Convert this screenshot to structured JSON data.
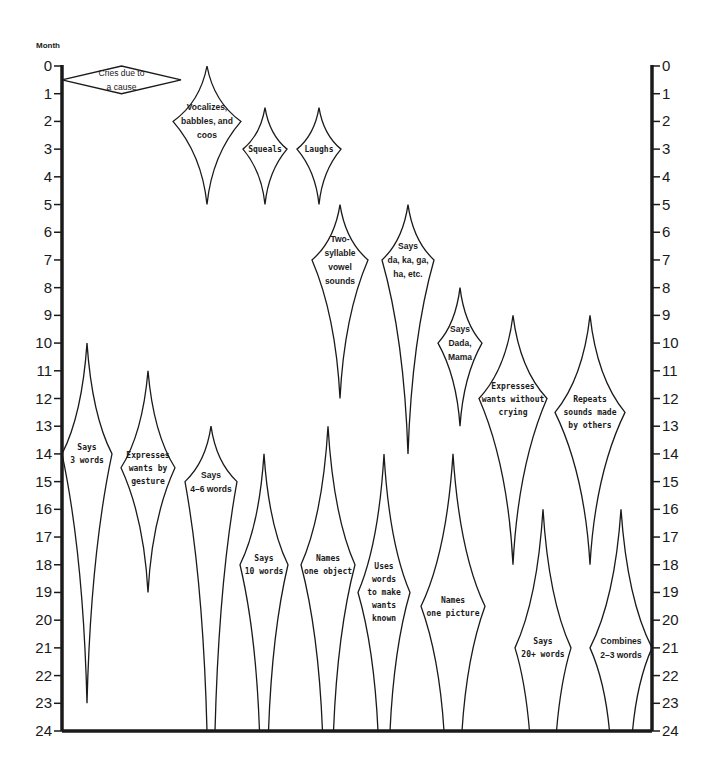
{
  "chart_data": {
    "type": "range-diagram",
    "title": "",
    "ylabel": "Month",
    "ylim": [
      0,
      24
    ],
    "y_ticks": [
      0,
      1,
      2,
      3,
      4,
      5,
      6,
      7,
      8,
      9,
      10,
      11,
      12,
      13,
      14,
      15,
      16,
      17,
      18,
      19,
      20,
      21,
      22,
      23,
      24
    ],
    "y_axis_inverted": true,
    "axes": {
      "left_axis": true,
      "right_axis": true,
      "bottom_axis": true,
      "grid": false
    },
    "milestones": [
      {
        "label": [
          "Cries due to",
          "a cause"
        ],
        "orientation": "horizontal",
        "start_month": 0,
        "peak_month": 0.5,
        "end_month": 1,
        "x_start": 62,
        "x_end": 181,
        "style": "plain"
      },
      {
        "label": [
          "Vocalizes,",
          "babbles, and",
          "coos"
        ],
        "start_month": 0,
        "peak_month": 2,
        "end_month": 5,
        "cx": 207,
        "half_width": 34,
        "style": "bold"
      },
      {
        "label": [
          "Squeals"
        ],
        "start_month": 1.5,
        "peak_month": 3,
        "end_month": 5,
        "cx": 265,
        "half_width": 22,
        "style": "condensed"
      },
      {
        "label": [
          "Laughs"
        ],
        "start_month": 1.5,
        "peak_month": 3,
        "end_month": 5,
        "cx": 319,
        "half_width": 22,
        "style": "condensed"
      },
      {
        "label": [
          "Two-",
          "syllable",
          "vowel",
          "sounds"
        ],
        "start_month": 5,
        "peak_month": 7,
        "end_month": 12,
        "cx": 340,
        "half_width": 28,
        "style": "bold"
      },
      {
        "label": [
          "Says",
          "da, ka, ga,",
          "ha, etc."
        ],
        "start_month": 5,
        "peak_month": 7,
        "end_month": 14,
        "cx": 408,
        "half_width": 26,
        "style": "bold"
      },
      {
        "label": [
          "Says",
          "Dada,",
          "Mama"
        ],
        "start_month": 8,
        "peak_month": 10,
        "end_month": 13,
        "cx": 460,
        "half_width": 22,
        "style": "bold"
      },
      {
        "label": [
          "Expresses",
          "wants without",
          "crying"
        ],
        "start_month": 9,
        "peak_month": 12,
        "end_month": 18,
        "cx": 513,
        "half_width": 34,
        "style": "condensed"
      },
      {
        "label": [
          "Repeats",
          "sounds made",
          "by others"
        ],
        "start_month": 9,
        "peak_month": 12.5,
        "end_month": 18,
        "cx": 590,
        "half_width": 35,
        "style": "condensed"
      },
      {
        "label": [
          "Says",
          "3 words"
        ],
        "start_month": 10,
        "peak_month": 14,
        "end_month": 23,
        "cx": 87,
        "half_width": 25,
        "style": "condensed"
      },
      {
        "label": [
          "Expresses",
          "wants by",
          "gesture"
        ],
        "start_month": 11,
        "peak_month": 14.5,
        "end_month": 19,
        "cx": 148,
        "half_width": 27,
        "style": "condensed"
      },
      {
        "label": [
          "Says",
          "4–6 words"
        ],
        "start_month": 13,
        "peak_month": 15,
        "end_month": 24,
        "end_open_width": 8,
        "cx": 211,
        "half_width": 26,
        "style": "bold"
      },
      {
        "label": [
          "Says",
          "10 words"
        ],
        "start_month": 14,
        "peak_month": 18,
        "end_month": 24,
        "end_open_width": 9,
        "cx": 264,
        "half_width": 24,
        "style": "condensed"
      },
      {
        "label": [
          "Names",
          "one object"
        ],
        "start_month": 13,
        "peak_month": 18,
        "end_month": 24,
        "end_open_width": 11,
        "cx": 328,
        "half_width": 27,
        "style": "condensed"
      },
      {
        "label": [
          "Uses",
          "words",
          "to make",
          "wants",
          "known"
        ],
        "start_month": 14,
        "peak_month": 19,
        "end_month": 24,
        "end_open_width": 12,
        "cx": 384,
        "half_width": 26,
        "style": "condensed"
      },
      {
        "label": [
          "Names",
          "one picture"
        ],
        "start_month": 14,
        "peak_month": 19.5,
        "end_month": 24,
        "end_open_width": 18,
        "cx": 453,
        "half_width": 32,
        "style": "condensed"
      },
      {
        "label": [
          "Says",
          "20+ words"
        ],
        "start_month": 16,
        "peak_month": 21,
        "end_month": 24,
        "end_open_width": 27,
        "cx": 543,
        "half_width": 28,
        "style": "condensed"
      },
      {
        "label": [
          "Combines",
          "2–3 words"
        ],
        "start_month": 16,
        "peak_month": 21,
        "end_month": 24,
        "end_open_width": 23,
        "cx": 621,
        "half_width": 31,
        "style": "bold"
      }
    ]
  },
  "layout": {
    "left_axis_x": 62,
    "right_axis_x": 652,
    "y0": 66,
    "y24": 731
  }
}
